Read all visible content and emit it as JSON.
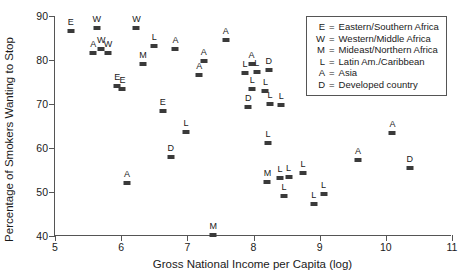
{
  "chart_data": {
    "type": "scatter",
    "title": "",
    "xlabel": "Gross National Income per Capita (log)",
    "ylabel": "Percentage of Smokers Wanting to Stop",
    "xlim": [
      5,
      11
    ],
    "ylim": [
      40,
      90
    ],
    "xticks": [
      5,
      6,
      7,
      8,
      9,
      10,
      11
    ],
    "yticks": [
      40,
      50,
      60,
      70,
      80,
      90
    ],
    "grid": false,
    "legend_position": "top-right",
    "legend": [
      {
        "key": "E",
        "label": "Eastern/Southern Africa"
      },
      {
        "key": "W",
        "label": "Western/Middle Africa"
      },
      {
        "key": "M",
        "label": "Mideast/Northern Africa"
      },
      {
        "key": "L",
        "label": "Latin Am./Caribbean"
      },
      {
        "key": "A",
        "label": "Asia"
      },
      {
        "key": "D",
        "label": "Developed country"
      }
    ],
    "marker_color": "#3a3a3a",
    "points": [
      {
        "label": "E",
        "x": 5.24,
        "y": 86.6
      },
      {
        "label": "W",
        "x": 5.63,
        "y": 87.3
      },
      {
        "label": "A",
        "x": 5.58,
        "y": 81.7
      },
      {
        "label": "W",
        "x": 5.7,
        "y": 82.6
      },
      {
        "label": "W",
        "x": 5.8,
        "y": 81.6
      },
      {
        "label": "E",
        "x": 5.94,
        "y": 74.0
      },
      {
        "label": "E",
        "x": 6.02,
        "y": 73.5
      },
      {
        "label": "A",
        "x": 6.09,
        "y": 52.0
      },
      {
        "label": "W",
        "x": 6.23,
        "y": 87.2
      },
      {
        "label": "M",
        "x": 6.33,
        "y": 79.0
      },
      {
        "label": "L",
        "x": 6.5,
        "y": 83.1
      },
      {
        "label": "E",
        "x": 6.63,
        "y": 68.4
      },
      {
        "label": "D",
        "x": 6.75,
        "y": 57.9
      },
      {
        "label": "A",
        "x": 6.82,
        "y": 82.6
      },
      {
        "label": "L",
        "x": 6.98,
        "y": 63.6
      },
      {
        "label": "A",
        "x": 7.18,
        "y": 76.6
      },
      {
        "label": "A",
        "x": 7.25,
        "y": 79.8
      },
      {
        "label": "M",
        "x": 7.39,
        "y": 40.2
      },
      {
        "label": "A",
        "x": 7.58,
        "y": 84.6
      },
      {
        "label": "L",
        "x": 7.87,
        "y": 77.1
      },
      {
        "label": "A",
        "x": 7.97,
        "y": 79.0
      },
      {
        "label": "L",
        "x": 8.05,
        "y": 77.2
      },
      {
        "label": "L",
        "x": 7.98,
        "y": 73.5
      },
      {
        "label": "D",
        "x": 7.92,
        "y": 69.4
      },
      {
        "label": "D",
        "x": 8.23,
        "y": 77.8
      },
      {
        "label": "L",
        "x": 8.18,
        "y": 72.9
      },
      {
        "label": "L",
        "x": 8.25,
        "y": 70.0
      },
      {
        "label": "L",
        "x": 8.42,
        "y": 69.8
      },
      {
        "label": "L",
        "x": 8.22,
        "y": 61.2
      },
      {
        "label": "M",
        "x": 8.21,
        "y": 52.3
      },
      {
        "label": "L",
        "x": 8.4,
        "y": 53.2
      },
      {
        "label": "L",
        "x": 8.53,
        "y": 53.4
      },
      {
        "label": "L",
        "x": 8.75,
        "y": 54.3
      },
      {
        "label": "L",
        "x": 8.46,
        "y": 49.0
      },
      {
        "label": "L",
        "x": 8.91,
        "y": 47.3
      },
      {
        "label": "L",
        "x": 9.06,
        "y": 49.6
      },
      {
        "label": "A",
        "x": 9.58,
        "y": 57.3
      },
      {
        "label": "A",
        "x": 10.1,
        "y": 63.4
      },
      {
        "label": "D",
        "x": 10.36,
        "y": 55.5
      }
    ]
  }
}
